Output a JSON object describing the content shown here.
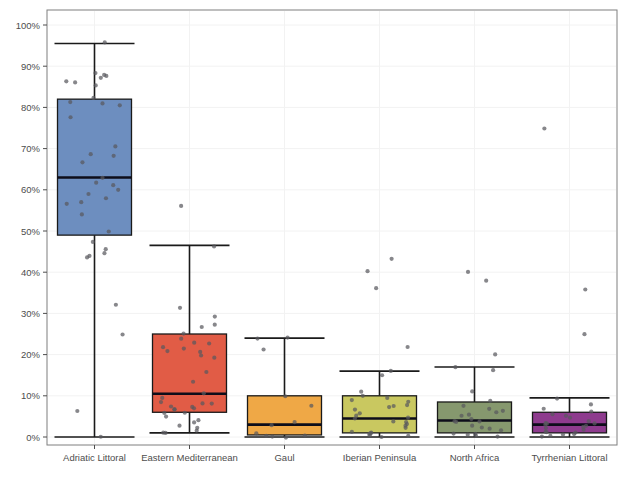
{
  "chart_data": {
    "type": "box",
    "title": "",
    "xlabel": "",
    "ylabel": "",
    "ylim": [
      0,
      100
    ],
    "y_unit": "%",
    "grid": true,
    "legend": "none",
    "y_ticks": [
      0,
      10,
      20,
      30,
      40,
      50,
      60,
      70,
      80,
      90,
      100
    ],
    "y_tick_labels": [
      "0%",
      "10%",
      "20%",
      "30%",
      "40%",
      "50%",
      "60%",
      "70%",
      "80%",
      "90%",
      "100%"
    ],
    "categories": [
      "Adriatic Littoral",
      "Eastern Mediterranean",
      "Gaul",
      "Iberian Peninsula",
      "North Africa",
      "Tyrrhenian Littoral"
    ],
    "boxes": [
      {
        "category": "Adriatic Littoral",
        "color": "#6d8ebf",
        "whisker_low": 0.0,
        "q1": 49.0,
        "median": 63.0,
        "q3": 82.0,
        "whisker_high": 95.5,
        "points": [
          95.5,
          88.5,
          87.5,
          86.5,
          86.0,
          87.0,
          85.5,
          88.0,
          82.5,
          81.0,
          80.5,
          81.5,
          77.5,
          70.5,
          68.0,
          66.5,
          68.5,
          63.0,
          61.5,
          61.0,
          59.0,
          60.0,
          57.0,
          58.0,
          56.5,
          54.0,
          50.0,
          47.5,
          45.5,
          44.5,
          44.0,
          43.5,
          32.0,
          25.0,
          6.5,
          0.0
        ]
      },
      {
        "category": "Eastern Mediterranean",
        "color": "#e15c46",
        "whisker_low": 1.0,
        "q1": 6.0,
        "median": 10.5,
        "q3": 25.0,
        "whisker_high": 46.5,
        "points": [
          56.0,
          46.5,
          31.5,
          27.5,
          29.0,
          26.5,
          25.0,
          23.0,
          24.0,
          22.5,
          21.5,
          22.0,
          21.0,
          20.5,
          19.5,
          20.0,
          16.0,
          13.5,
          10.5,
          9.5,
          8.5,
          8.0,
          7.5,
          7.0,
          6.5,
          6.5,
          6.0,
          6.0,
          7.5,
          8.0,
          5.0,
          4.0,
          3.5,
          3.0,
          2.0,
          1.5,
          1.0,
          1.0
        ]
      },
      {
        "category": "Gaul",
        "color": "#efa846",
        "whisker_low": 0.0,
        "q1": 0.5,
        "median": 3.0,
        "q3": 10.0,
        "whisker_high": 24.0,
        "points": [
          24.0,
          24.0,
          21.0,
          10.0,
          7.5,
          3.5,
          3.0,
          1.0,
          0.5,
          0.5,
          0.0,
          0.0
        ]
      },
      {
        "category": "Iberian Peninsula",
        "color": "#c9c860",
        "whisker_low": 0.0,
        "q1": 1.0,
        "median": 4.5,
        "q3": 10.0,
        "whisker_high": 16.0,
        "points": [
          43.0,
          40.0,
          36.0,
          22.0,
          16.0,
          15.0,
          11.0,
          10.0,
          9.5,
          9.0,
          8.5,
          8.0,
          7.5,
          7.0,
          6.5,
          6.0,
          5.0,
          4.5,
          4.5,
          4.0,
          3.5,
          3.0,
          2.5,
          2.0,
          1.5,
          1.0,
          1.0,
          0.5,
          0.5,
          0.0,
          0.0
        ]
      },
      {
        "category": "North Africa",
        "color": "#86986e",
        "whisker_low": 0.0,
        "q1": 1.0,
        "median": 4.0,
        "q3": 8.5,
        "whisker_high": 17.0,
        "points": [
          40.0,
          38.0,
          20.0,
          17.0,
          16.0,
          11.0,
          8.5,
          7.5,
          7.0,
          6.5,
          6.0,
          5.5,
          5.0,
          4.5,
          4.0,
          4.0,
          3.5,
          3.0,
          2.5,
          2.0,
          1.5,
          1.0,
          1.0,
          0.5,
          0.5,
          0.0
        ]
      },
      {
        "category": "Tyrrhenian Littoral",
        "color": "#8e3b8e",
        "whisker_low": 0.0,
        "q1": 1.0,
        "median": 3.0,
        "q3": 6.0,
        "whisker_high": 9.5,
        "points": [
          75.0,
          36.0,
          25.0,
          9.5,
          8.0,
          7.0,
          6.0,
          5.5,
          5.0,
          4.5,
          4.0,
          3.5,
          3.5,
          3.0,
          3.0,
          2.5,
          2.5,
          2.0,
          2.0,
          1.5,
          1.0,
          1.0,
          0.5,
          0.5,
          0.0,
          0.0
        ]
      }
    ]
  },
  "style": {
    "panel_background": "#ffffff",
    "panel_border": "#7f7f7f",
    "grid_color": "#f2f2f2",
    "outline_color": "#1a1a1a",
    "point_color": "#59595e",
    "axis_text_color": "#4d4d4d"
  }
}
